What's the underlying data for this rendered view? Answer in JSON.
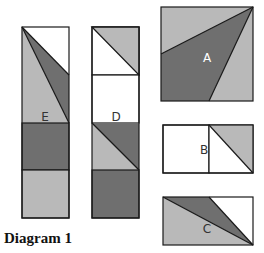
{
  "caption": "Diagram 1",
  "colors": {
    "light": "#b9b9b9",
    "dark": "#6f6f6f",
    "white": "#ffffff",
    "stroke": "#1a1a1a",
    "label_light": "#ffffff",
    "label_dark": "#333333"
  },
  "blocks": {
    "E": {
      "label": "E"
    },
    "D": {
      "label": "D"
    },
    "A": {
      "label": "A"
    },
    "B": {
      "label": "B"
    },
    "C": {
      "label": "C"
    }
  }
}
